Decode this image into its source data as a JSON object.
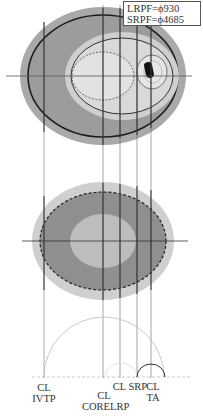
{
  "legend": {
    "lines": [
      "LRPF=ϕ930",
      "SRPF=ϕ4685"
    ]
  },
  "labels": {
    "cl_ivtp": [
      "CL",
      "IVTP"
    ],
    "cl_corelrp": [
      "CL",
      "CORELRP"
    ],
    "cl_srp": "CL SRP",
    "cl_ta": [
      "CL",
      "TA"
    ]
  },
  "colors": {
    "outer_ring": "#a8a8a8",
    "dark_region": "#9a9a9a",
    "light_ring": "#d4d4d4",
    "inner_light": "#dedede",
    "core_dark": "#777777",
    "lower_outer": "#cfcfcf",
    "lower_mid": "#8f8f8f",
    "lower_inner": "#bdbdbd",
    "line": "#222222",
    "guide": "#777777"
  },
  "guide_lines_x": [
    44,
    103,
    120,
    137,
    151
  ]
}
